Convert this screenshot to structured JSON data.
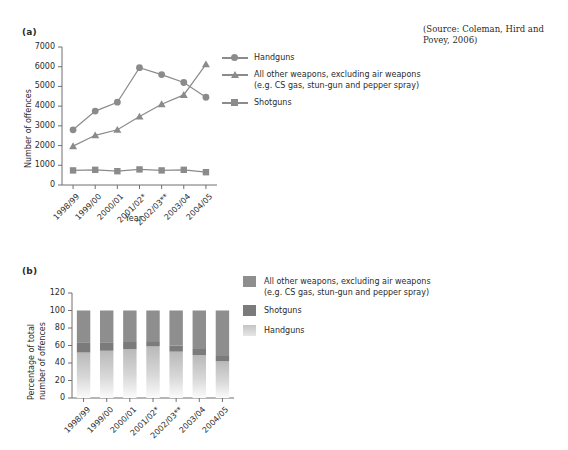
{
  "source_note": "(Source: Coleman, Hird and Povey, 2006)",
  "panel_a": {
    "label": "(a)",
    "legend": [
      {
        "key": "circle",
        "text": "Handguns"
      },
      {
        "key": "triangle",
        "text": "All other weapons, excluding air weapons"
      },
      {
        "key": "none",
        "text": "(e.g. CS gas, stun-gun and pepper spray)"
      },
      {
        "key": "square",
        "text": "Shotguns"
      }
    ]
  },
  "panel_b": {
    "label": "(b)",
    "legend": [
      {
        "color": "#8e8e8e",
        "text": "All other weapons, excluding air weapons"
      },
      {
        "color": "",
        "text": "(e.g. CS gas, stun-gun and pepper spray)"
      },
      {
        "color": "#7b7b7b",
        "text": "Shotguns"
      },
      {
        "color": "#c9c9c9",
        "text": "Handguns"
      }
    ]
  },
  "colors": {
    "line": "#8b8b8b",
    "axis": "#6f6f6f",
    "text": "#2b2b2b",
    "other_weapons": "#8e8e8e",
    "shotguns": "#7b7b7b",
    "handguns": "#c9c9c9"
  },
  "chart_data": [
    {
      "type": "line",
      "panel": "(a)",
      "title": "",
      "xlabel": "Year",
      "ylabel": "Number of offences",
      "ylim": [
        0,
        7000
      ],
      "yticks": [
        0,
        1000,
        2000,
        3000,
        4000,
        5000,
        6000,
        7000
      ],
      "ytick_labels": [
        "0",
        "1000",
        "2000",
        "3000",
        "4000",
        "5000",
        "6000",
        "7000"
      ],
      "grid": false,
      "legend_position": "right",
      "categories": [
        "1998/99",
        "1999/00",
        "2000/01",
        "2001/02*",
        "2002/03**",
        "2003/04",
        "2004/05"
      ],
      "series": [
        {
          "name": "Handguns",
          "marker": "circle",
          "values": [
            2800,
            3750,
            4200,
            5950,
            5600,
            5200,
            4450
          ]
        },
        {
          "name": "All other weapons, excluding air weapons (e.g. CS gas, stun-gun and pepper spray)",
          "marker": "triangle",
          "values": [
            1970,
            2520,
            2800,
            3470,
            4100,
            4570,
            6120
          ]
        },
        {
          "name": "Shotguns",
          "marker": "square",
          "values": [
            740,
            770,
            700,
            790,
            740,
            770,
            650
          ]
        }
      ]
    },
    {
      "type": "bar",
      "subtype": "stacked",
      "panel": "(b)",
      "title": "",
      "xlabel": "",
      "ylabel": "Percentage of total number of offences",
      "ylim": [
        0,
        120
      ],
      "yticks": [
        0,
        20,
        40,
        60,
        80,
        100,
        120
      ],
      "ytick_labels": [
        "0",
        "20",
        "40",
        "60",
        "80",
        "100",
        "120"
      ],
      "grid": false,
      "legend_position": "right",
      "categories": [
        "1998/99",
        "1999/00",
        "2000/01",
        "2001/02*",
        "2002/03**",
        "2003/04",
        "2004/05"
      ],
      "series": [
        {
          "name": "Handguns",
          "color": "#c9c9c9",
          "values": [
            52,
            54,
            56,
            59,
            53,
            49,
            42
          ]
        },
        {
          "name": "Shotguns",
          "color": "#7b7b7b",
          "values": [
            11,
            9,
            8,
            6,
            7,
            7,
            6
          ]
        },
        {
          "name": "All other weapons, excluding air weapons (e.g. CS gas, stun-gun and pepper spray)",
          "color": "#8e8e8e",
          "values": [
            37,
            37,
            36,
            35,
            40,
            44,
            52
          ]
        }
      ]
    }
  ]
}
